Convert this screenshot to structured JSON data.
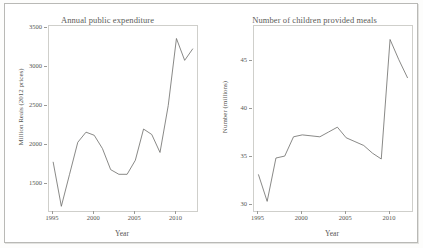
{
  "figure": {
    "background_color": "#ffffff",
    "line_color": "#6b6b68",
    "axis_color": "#cfcfcb"
  },
  "chart_data": [
    {
      "type": "line",
      "title": "Annual public expenditure",
      "xlabel": "Year",
      "ylabel": "Million Reais (2012 prices)",
      "xlim": [
        1994.5,
        2012.5
      ],
      "ylim": [
        1150,
        3520
      ],
      "xticks": [
        1995,
        2000,
        2005,
        2010
      ],
      "yticks": [
        1500,
        2000,
        2500,
        3000,
        3500
      ],
      "grid": false,
      "legend": "none",
      "x": [
        1995,
        1996,
        1997,
        1998,
        1999,
        2000,
        2001,
        2002,
        2003,
        2004,
        2005,
        2006,
        2007,
        2008,
        2009,
        2010,
        2011,
        2012
      ],
      "values": [
        1780,
        1210,
        1620,
        2030,
        2160,
        2120,
        1950,
        1680,
        1620,
        1620,
        1800,
        2200,
        2130,
        1900,
        2500,
        3360,
        3080,
        3230
      ]
    },
    {
      "type": "line",
      "title": "Number of children provided meals",
      "xlabel": "Year",
      "ylabel": "Number (millions)",
      "xlim": [
        1994.5,
        2012.5
      ],
      "ylim": [
        29.4,
        48.6
      ],
      "xticks": [
        1995,
        2000,
        2005,
        2010
      ],
      "yticks": [
        30,
        35,
        40,
        45
      ],
      "grid": false,
      "legend": "none",
      "x": [
        1995,
        1996,
        1997,
        1998,
        1999,
        2000,
        2001,
        2002,
        2003,
        2004,
        2005,
        2006,
        2007,
        2008,
        2009,
        2010,
        2011,
        2012
      ],
      "values": [
        33.2,
        30.4,
        34.9,
        35.1,
        37.1,
        37.3,
        37.2,
        37.1,
        37.6,
        38.1,
        37.0,
        36.6,
        36.2,
        35.4,
        34.8,
        47.2,
        45.1,
        43.2
      ]
    }
  ]
}
